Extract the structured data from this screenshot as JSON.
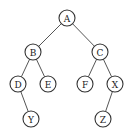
{
  "diagram": {
    "type": "binary-tree",
    "root": "A",
    "nodes": [
      {
        "id": "A",
        "label": "A",
        "x": 67,
        "y": 18
      },
      {
        "id": "B",
        "label": "B",
        "x": 33,
        "y": 52
      },
      {
        "id": "C",
        "label": "C",
        "x": 100,
        "y": 52
      },
      {
        "id": "D",
        "label": "D",
        "x": 18,
        "y": 84
      },
      {
        "id": "E",
        "label": "E",
        "x": 48,
        "y": 84
      },
      {
        "id": "F",
        "label": "F",
        "x": 85,
        "y": 84
      },
      {
        "id": "X",
        "label": "X",
        "x": 115,
        "y": 84
      },
      {
        "id": "Y",
        "label": "Y",
        "x": 31,
        "y": 119
      },
      {
        "id": "Z",
        "label": "Z",
        "x": 103,
        "y": 119
      }
    ],
    "edges": [
      {
        "from": "A",
        "to": "B",
        "side": "left"
      },
      {
        "from": "A",
        "to": "C",
        "side": "right"
      },
      {
        "from": "B",
        "to": "D",
        "side": "left"
      },
      {
        "from": "B",
        "to": "E",
        "side": "right"
      },
      {
        "from": "C",
        "to": "F",
        "side": "left"
      },
      {
        "from": "C",
        "to": "X",
        "side": "right"
      },
      {
        "from": "D",
        "to": "Y",
        "side": "right"
      },
      {
        "from": "X",
        "to": "Z",
        "side": "left"
      }
    ],
    "node_radius": 8
  }
}
